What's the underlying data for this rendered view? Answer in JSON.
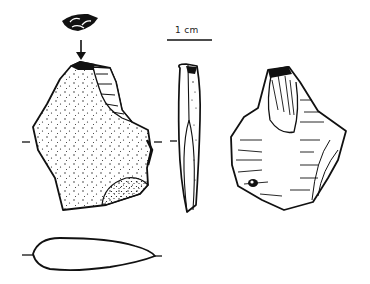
{
  "figure": {
    "scale_bar": {
      "label": "1 cm"
    },
    "views": [
      {
        "id": "platform",
        "description": "butt / striking platform view"
      },
      {
        "id": "dorsal",
        "description": "dorsal face with cortex stippling"
      },
      {
        "id": "profile",
        "description": "lateral profile"
      },
      {
        "id": "ventral",
        "description": "ventral face with flake scars"
      },
      {
        "id": "cross-section",
        "description": "transverse cross-section"
      }
    ],
    "colors": {
      "ink": "#111111",
      "background": "#ffffff"
    }
  }
}
